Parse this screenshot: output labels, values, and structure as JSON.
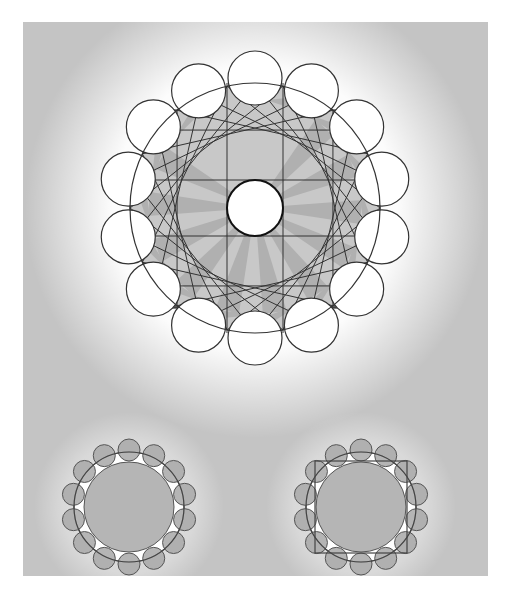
{
  "figure": {
    "panel": {
      "x": 23,
      "y": 22,
      "w": 465,
      "h": 554,
      "background": "#c4c4c4"
    },
    "main_diagram": {
      "center": [
        232,
        186
      ],
      "inner_circle_r": 28,
      "outer_circle_r": 125,
      "square_half": 99,
      "petal_count": 14,
      "petal_r": 27,
      "petal_ring_r": 130,
      "star_step": 5,
      "colors": {
        "dark": "#595959",
        "mid": "#9a9a9a",
        "light": "#c8c8c8",
        "white": "#ffffff",
        "stroke": "#333333"
      }
    },
    "small_diagrams": [
      {
        "name": "left",
        "center": [
          106,
          485
        ],
        "inner_r": 45,
        "ring_r": 55,
        "petal_count": 14,
        "petal_r": 11,
        "petal_ring_r": 57,
        "square": false
      },
      {
        "name": "right",
        "center": [
          338,
          485
        ],
        "inner_r": 45,
        "ring_r": 55,
        "petal_count": 14,
        "petal_r": 11,
        "petal_ring_r": 57,
        "square": true,
        "square_half": 46
      }
    ]
  }
}
